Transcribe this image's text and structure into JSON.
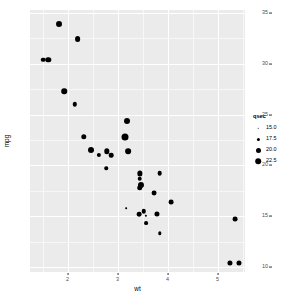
{
  "chart_data": {
    "type": "scatter",
    "title": "",
    "xlabel": "wt",
    "ylabel": "mpg",
    "xlim": [
      1.25,
      5.55
    ],
    "ylim": [
      9.5,
      35.3
    ],
    "xticks": [
      "2",
      "3",
      "4",
      "5"
    ],
    "xtick_values": [
      2,
      3,
      4,
      5
    ],
    "yticks": [
      "35",
      "30",
      "25",
      "20",
      "15",
      "10"
    ],
    "ytick_values": [
      35,
      30,
      25,
      20,
      15,
      10
    ],
    "grid": "major and minor white gridlines on grey panel",
    "legend": {
      "title": "qsec",
      "position": "right",
      "entries": [
        {
          "label": "15.0",
          "value": 15.0,
          "dot_px": 1.6
        },
        {
          "label": "17.5",
          "value": 17.5,
          "dot_px": 3.2
        },
        {
          "label": "20.0",
          "value": 20.0,
          "dot_px": 5.0
        },
        {
          "label": "22.5",
          "value": 22.5,
          "dot_px": 6.6
        }
      ]
    },
    "size_aes": "qsec",
    "panel_bg": "#ebebeb",
    "point_color": "#000000",
    "points": [
      {
        "x": 2.62,
        "y": 21.0,
        "size": 16.46
      },
      {
        "x": 2.875,
        "y": 21.0,
        "size": 17.02
      },
      {
        "x": 2.32,
        "y": 22.8,
        "size": 18.61
      },
      {
        "x": 3.215,
        "y": 21.4,
        "size": 19.44
      },
      {
        "x": 3.44,
        "y": 18.7,
        "size": 17.02
      },
      {
        "x": 3.46,
        "y": 18.1,
        "size": 20.22
      },
      {
        "x": 3.57,
        "y": 14.3,
        "size": 15.84
      },
      {
        "x": 3.19,
        "y": 24.4,
        "size": 20.0
      },
      {
        "x": 3.15,
        "y": 22.8,
        "size": 22.9
      },
      {
        "x": 3.44,
        "y": 19.2,
        "size": 18.3
      },
      {
        "x": 3.44,
        "y": 17.8,
        "size": 18.9
      },
      {
        "x": 4.07,
        "y": 16.4,
        "size": 17.4
      },
      {
        "x": 3.73,
        "y": 17.3,
        "size": 17.6
      },
      {
        "x": 3.78,
        "y": 15.2,
        "size": 18.0
      },
      {
        "x": 5.25,
        "y": 10.4,
        "size": 17.98
      },
      {
        "x": 5.424,
        "y": 10.4,
        "size": 17.82
      },
      {
        "x": 5.345,
        "y": 14.7,
        "size": 17.42
      },
      {
        "x": 2.2,
        "y": 32.4,
        "size": 19.47
      },
      {
        "x": 1.615,
        "y": 30.4,
        "size": 18.52
      },
      {
        "x": 1.835,
        "y": 33.9,
        "size": 19.9
      },
      {
        "x": 2.465,
        "y": 21.5,
        "size": 20.01
      },
      {
        "x": 3.52,
        "y": 15.5,
        "size": 16.87
      },
      {
        "x": 3.435,
        "y": 15.2,
        "size": 17.3
      },
      {
        "x": 3.84,
        "y": 13.3,
        "size": 15.41
      },
      {
        "x": 3.845,
        "y": 19.2,
        "size": 17.05
      },
      {
        "x": 1.935,
        "y": 27.3,
        "size": 18.9
      },
      {
        "x": 2.14,
        "y": 26.0,
        "size": 16.7
      },
      {
        "x": 1.513,
        "y": 30.4,
        "size": 16.9
      },
      {
        "x": 3.17,
        "y": 15.8,
        "size": 14.5
      },
      {
        "x": 2.77,
        "y": 19.7,
        "size": 15.5
      },
      {
        "x": 3.57,
        "y": 15.0,
        "size": 14.6
      },
      {
        "x": 2.78,
        "y": 21.4,
        "size": 18.6
      }
    ]
  }
}
